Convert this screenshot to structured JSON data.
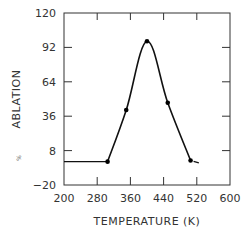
{
  "chart_data": {
    "type": "line",
    "title": "",
    "xlabel": "TEMPERATURE (K)",
    "ylabel": "ABLATION",
    "ylabel_prefix": "%",
    "xlim": [
      200,
      600
    ],
    "ylim": [
      -20,
      120
    ],
    "xticks": [
      200,
      280,
      360,
      440,
      520,
      600
    ],
    "yticks": [
      -20,
      8,
      36,
      64,
      92,
      120
    ],
    "grid": false,
    "legend": "none",
    "series": [
      {
        "name": "ablation",
        "line_start": {
          "x": 200,
          "y": -1
        },
        "points": [
          {
            "x": 305,
            "y": -1
          },
          {
            "x": 350,
            "y": 41
          },
          {
            "x": 400,
            "y": 97
          },
          {
            "x": 450,
            "y": 47
          },
          {
            "x": 505,
            "y": 0
          }
        ],
        "line_end": {
          "x": 525,
          "y": -2
        }
      }
    ]
  }
}
